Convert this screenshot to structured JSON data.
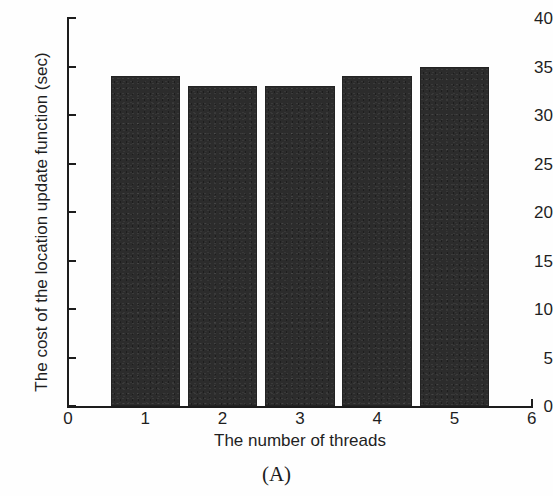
{
  "figure": {
    "caption": "(A)",
    "bar_color": "#2c2c2c",
    "axis_color": "#1d1d1d",
    "background": "#ffffff"
  },
  "chart_data": {
    "type": "bar",
    "title": "",
    "xlabel": "The number of threads",
    "ylabel": "The cost of the location update function (sec)",
    "categories": [
      "1",
      "2",
      "3",
      "4",
      "5"
    ],
    "values": [
      34,
      33,
      33,
      34,
      35
    ],
    "series": [
      {
        "name": "The cost of the location update function (sec)",
        "values": [
          34,
          33,
          33,
          34,
          35
        ]
      }
    ],
    "xlim": [
      0,
      6
    ],
    "ylim": [
      0,
      40
    ],
    "xticks": [
      "0",
      "1",
      "2",
      "3",
      "4",
      "5",
      "6"
    ],
    "yticks": [
      "0",
      "5",
      "10",
      "15",
      "20",
      "25",
      "30",
      "35",
      "40"
    ],
    "xtick_values": [
      0,
      1,
      2,
      3,
      4,
      5,
      6
    ],
    "ytick_values": [
      0,
      5,
      10,
      15,
      20,
      25,
      30,
      35,
      40
    ],
    "grid": false,
    "legend": null,
    "bar_width": 0.9,
    "annotations": [
      "(A)"
    ]
  }
}
